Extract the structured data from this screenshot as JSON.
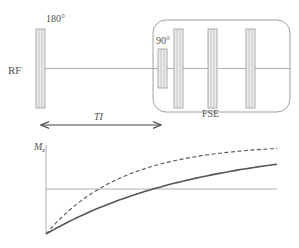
{
  "diagram": {
    "labels": {
      "rf": "RF",
      "inversion_pulse": "180°",
      "excitation_pulse": "90°",
      "fse_block": "FSE",
      "inversion_time": "TI",
      "mz_axis": "M",
      "mz_subscript": "z"
    },
    "sequence": {
      "inversion_pulse_flip_deg": 180,
      "excitation_pulse_flip_deg": 90,
      "refocusing_pulse_count": 3
    },
    "curves": [
      {
        "name": "recovery-curve-fast",
        "style": "dashed",
        "relaxation": "fast"
      },
      {
        "name": "recovery-curve-slow",
        "style": "solid",
        "relaxation": "slow"
      }
    ],
    "colors": {
      "line": "#8a8a8a",
      "pulse_fill": "#e6e6e6",
      "curve": "#555555"
    }
  }
}
